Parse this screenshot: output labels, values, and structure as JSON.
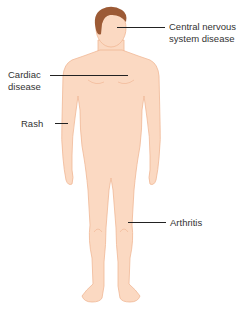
{
  "diagram": {
    "colors": {
      "skin": "#fbd9c2",
      "skin_outline": "#f0b896",
      "hair": "#9c5a35",
      "hair_dark": "#7a4326",
      "leader_line": "#222222",
      "label_text": "#333333"
    },
    "labels": [
      {
        "id": "cns",
        "text": "Central nervous\nsystem disease",
        "target": "head"
      },
      {
        "id": "cardiac",
        "text": "Cardiac\ndisease",
        "target": "chest"
      },
      {
        "id": "rash",
        "text": "Rash",
        "target": "arm"
      },
      {
        "id": "arthritis",
        "text": "Arthritis",
        "target": "knee"
      }
    ]
  }
}
